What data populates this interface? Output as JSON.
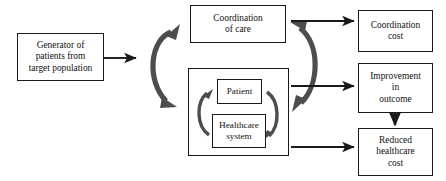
{
  "diagram": {
    "type": "flow-diagram",
    "title": "",
    "canvas": {
      "width": 446,
      "height": 181,
      "background": "#ffffff"
    },
    "colors": {
      "box_border": "#1a1a1a",
      "box_fill": "#ffffff",
      "text": "#111111",
      "straight_arrow": "#1a1a1a",
      "curved_arrow": "#4d4d4d"
    },
    "nodes": {
      "generator": {
        "label": "Generator of\npatients from\ntarget  population"
      },
      "coordination_of_care": {
        "label": "Coordination\nof care"
      },
      "cycle_group": {
        "label": ""
      },
      "patient": {
        "label": "Patient"
      },
      "healthcare_system": {
        "label": "Healthcare\nsystem"
      },
      "coordination_cost": {
        "label": "Coordination\ncost"
      },
      "improvement": {
        "label": "Improvement\nin\noutcome"
      },
      "reduced_cost": {
        "label": "Reduced\nhealthcare\ncost"
      }
    },
    "connectors": [
      {
        "name": "generator-to-hub",
        "kind": "straight-arrow",
        "heads": 1
      },
      {
        "name": "hub-bidirectional-left",
        "kind": "curved-double-arrow",
        "heads": 2
      },
      {
        "name": "patient-to-healthcare-cycle",
        "kind": "curved-arrow",
        "heads": 1
      },
      {
        "name": "healthcare-to-patient-cycle",
        "kind": "curved-arrow",
        "heads": 1
      },
      {
        "name": "hub-bidirectional-right",
        "kind": "curved-double-arrow",
        "heads": 2
      },
      {
        "name": "coordination-of-care-to-coordination-cost",
        "kind": "straight-arrow",
        "heads": 1
      },
      {
        "name": "cycle-to-improvement",
        "kind": "straight-arrow",
        "heads": 1
      },
      {
        "name": "cycle-to-reduced-cost",
        "kind": "straight-arrow",
        "heads": 1
      },
      {
        "name": "improvement-to-reduced-cost",
        "kind": "straight-arrow-vertical",
        "heads": 1
      }
    ]
  }
}
